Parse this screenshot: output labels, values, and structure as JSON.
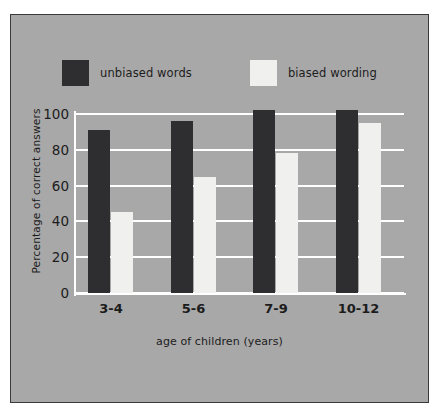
{
  "chart_data": {
    "type": "bar",
    "title": "",
    "xlabel": "age of children (years)",
    "ylabel": "Percentage of correct answers",
    "categories": [
      "3-4",
      "5-6",
      "7-9",
      "10-12"
    ],
    "series": [
      {
        "name": "unbiased words",
        "values": [
          91,
          96,
          102,
          102
        ],
        "color": "#2e2e30"
      },
      {
        "name": "biased wording",
        "values": [
          45,
          65,
          78,
          95
        ],
        "color": "#f0f0ee"
      }
    ],
    "ylim": [
      0,
      105
    ],
    "yticks": [
      0,
      20,
      40,
      60,
      80,
      100
    ],
    "ytick_labels": [
      "0",
      "20",
      "40",
      "60",
      "80",
      "100"
    ],
    "grid": "horizontal",
    "grid_color": "#ffffff",
    "legend_position": "top-center",
    "background_color": "#a8a8a8",
    "border_color": "#3a3a3a"
  },
  "legend": {
    "entries": [
      {
        "label": "unbiased words",
        "swatch": "dark"
      },
      {
        "label": "biased wording",
        "swatch": "light"
      }
    ]
  }
}
